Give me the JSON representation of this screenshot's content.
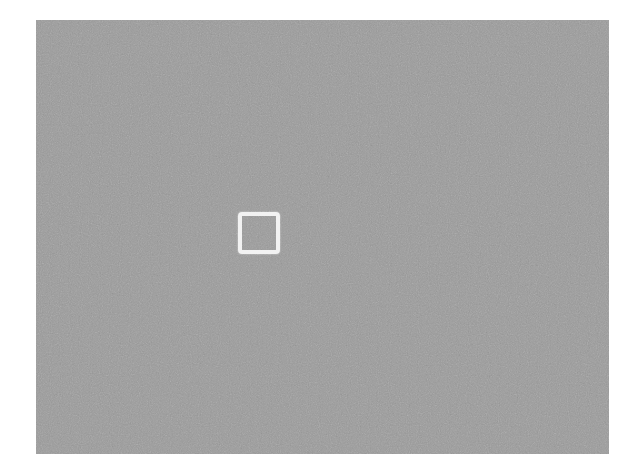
{
  "image": {
    "background_color": "#ffffff",
    "panel": {
      "fill_color": "#9b9b9b",
      "texture": "grainy-noise",
      "x": 36,
      "y": 20,
      "width": 573,
      "height": 434
    },
    "marker": {
      "shape": "square-outline",
      "stroke_color": "#f2f2f2",
      "stroke_width": 4,
      "x": 238,
      "y": 212,
      "width": 42,
      "height": 42
    }
  }
}
